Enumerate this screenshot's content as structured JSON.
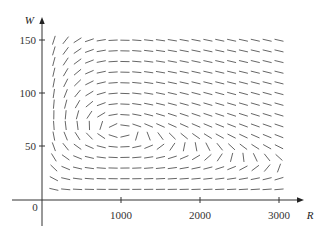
{
  "chart_data": {
    "type": "direction-field",
    "title": "",
    "xlabel": "R",
    "ylabel": "W",
    "x_ticks": [
      1000,
      2000,
      3000
    ],
    "y_ticks": [
      50,
      100,
      150
    ],
    "origin_label": "0",
    "xlim": [
      0,
      3000
    ],
    "ylim": [
      0,
      150
    ],
    "grid": false,
    "field": {
      "description": "Slope field of predator-prey system dW/dR",
      "dR_dt": "0.08R(1 - 0.0002R) - 0.001RW",
      "dW_dt": "-0.02W + 0.00002RW",
      "r_samples": [
        150,
        300,
        450,
        600,
        750,
        900,
        1050,
        1200,
        1350,
        1500,
        1650,
        1800,
        1950,
        2100,
        2250,
        2400,
        2550,
        2700,
        2850,
        3000
      ],
      "w_samples": [
        10,
        20,
        30,
        40,
        50,
        60,
        70,
        80,
        90,
        100,
        110,
        120,
        130,
        140,
        150
      ],
      "equilibrium_approx": [
        1000,
        64
      ]
    }
  },
  "axes": {
    "x_axis_label": "R",
    "y_axis_label": "W",
    "x_tick_labels": [
      "1000",
      "2000",
      "3000"
    ],
    "y_tick_labels": [
      "50",
      "100",
      "150"
    ],
    "origin_label": "0"
  }
}
